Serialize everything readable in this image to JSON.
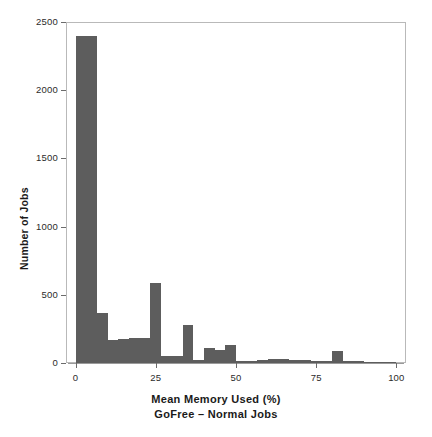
{
  "chart_data": {
    "type": "bar",
    "title": "",
    "xlabel": "Mean Memory Used (%)",
    "xlabel_sub": "GoFree – Normal Jobs",
    "ylabel": "Number of Jobs",
    "xlim": [
      -3,
      103
    ],
    "ylim": [
      0,
      2500
    ],
    "grid": false,
    "legend": null,
    "bar_color": "#5d5d5d",
    "axis_color": "#6b6b6b",
    "bin_width": 3.33,
    "xticks": [
      0,
      25,
      50,
      75,
      100
    ],
    "xtick_labels": [
      "0",
      "25",
      "50",
      "75",
      "100"
    ],
    "yticks": [
      0,
      500,
      1000,
      1500,
      2000,
      2500
    ],
    "ytick_labels": [
      "0",
      "500",
      "1000",
      "1500",
      "2000",
      "2500"
    ],
    "bin_starts": [
      0,
      3.33,
      6.67,
      10,
      13.33,
      16.67,
      20,
      23.33,
      26.67,
      30,
      33.33,
      36.67,
      40,
      43.33,
      46.67,
      50,
      53.33,
      56.67,
      60,
      63.33,
      66.67,
      70,
      73.33,
      76.67,
      80,
      83.33,
      86.67,
      90,
      93.33,
      96.67
    ],
    "values": [
      2400,
      2400,
      370,
      170,
      175,
      180,
      180,
      590,
      55,
      50,
      280,
      25,
      110,
      95,
      135,
      18,
      14,
      22,
      30,
      30,
      22,
      20,
      18,
      16,
      85,
      14,
      12,
      10,
      8,
      6
    ]
  },
  "axis": {
    "ylabel": "Number of Jobs",
    "xlabel": "Mean Memory Used (%)",
    "xlabel_sub": "GoFree – Normal Jobs"
  }
}
